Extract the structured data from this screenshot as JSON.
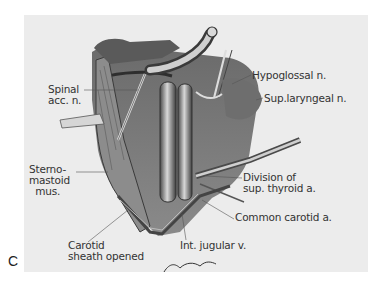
{
  "figure": {
    "panel_letter": "C",
    "colors": {
      "background": "#ffffff",
      "panel": "#ececec",
      "tissue_dark": "#3a3a3a",
      "tissue_mid": "#7a7a7a",
      "tissue_light": "#c4c4c4",
      "label_text": "#333333"
    },
    "labels": [
      {
        "id": "spinal-acc-n",
        "text": "Spinal\nacc. n.",
        "x": 48,
        "y": 84
      },
      {
        "id": "hypoglossal-n",
        "text": "Hypoglossal n.",
        "x": 252,
        "y": 70
      },
      {
        "id": "sup-laryngeal-n",
        "text": "Sup.laryngeal n.",
        "x": 264,
        "y": 93
      },
      {
        "id": "sternomastoid-mus",
        "text": "Sterno-\nmastoid\n  mus.",
        "x": 29,
        "y": 164
      },
      {
        "id": "division-sup-thyroid-a",
        "text": "Division of\nsup. thyroid a.",
        "x": 243,
        "y": 172
      },
      {
        "id": "common-carotid-a",
        "text": "Common carotid a.",
        "x": 235,
        "y": 212
      },
      {
        "id": "carotid-sheath-opened",
        "text": "Carotid\nsheath opened",
        "x": 68,
        "y": 240
      },
      {
        "id": "int-jugular-v",
        "text": "Int. jugular v.",
        "x": 180,
        "y": 240
      }
    ],
    "signature": "Levi Hamilton (artist signature)"
  }
}
